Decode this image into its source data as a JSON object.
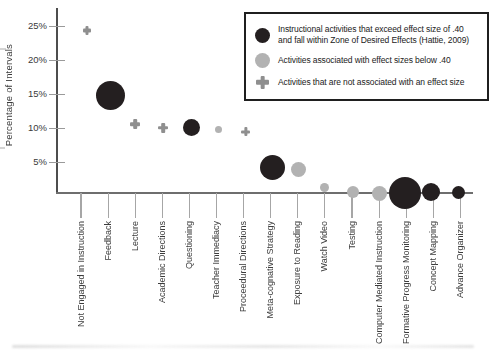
{
  "colors": {
    "black_marker": "#241f20",
    "gray_marker": "#b2b2b2",
    "plus_marker": "#8f8f8f",
    "axis": "#4d4d4d",
    "text": "#3c3c3c"
  },
  "chart_data": {
    "type": "scatter",
    "title": "",
    "xlabel": "",
    "ylabel": "Percentage of Intervals",
    "ylim": [
      0,
      26.5
    ],
    "grid": false,
    "legend_position": "top-right",
    "y_ticks": [
      {
        "value": 5,
        "label": "5%"
      },
      {
        "value": 10,
        "label": "10%"
      },
      {
        "value": 15,
        "label": "15%"
      },
      {
        "value": 20,
        "label": "20%"
      },
      {
        "value": 25,
        "label": "25%"
      }
    ],
    "legend_items": [
      {
        "icon": "black-circle",
        "color": "#241f20",
        "label": "Instructional activities that exceed effect size of .40\nand fall within Zone of Desired Effects (Hattie, 2009)"
      },
      {
        "icon": "gray-circle",
        "color": "#b2b2b2",
        "label": "Activities associated with effect sizes below .40"
      },
      {
        "icon": "plus",
        "color": "#8f8f8f",
        "label": "Activities that are not associated with an effect size"
      }
    ],
    "categories": [
      "Not Engaged in Instruction",
      "Feedback",
      "Lecture",
      "Academic Directions",
      "Questioning",
      "Teacher Immediacy",
      "Proceedural Directions",
      "Meta-cognative Strategy",
      "Exposure to Reading",
      "Watch Video",
      "Testing",
      "Computer Mediated Instruction",
      "Formative Progress Monitoring",
      "Concept Mapping",
      "Advance Organizer"
    ],
    "points": [
      {
        "category": "Not Engaged in Instruction",
        "value": 24.4,
        "marker": "plus",
        "size": 8.5,
        "dx": 6
      },
      {
        "category": "Feedback",
        "value": 14.8,
        "marker": "black-circle",
        "radius": 14.5,
        "dx": 2
      },
      {
        "category": "Lecture",
        "value": 10.6,
        "marker": "plus",
        "size": 10,
        "dx": 0
      },
      {
        "category": "Academic Directions",
        "value": 10.1,
        "marker": "plus",
        "size": 10,
        "dx": 1
      },
      {
        "category": "Questioning",
        "value": 10.1,
        "marker": "black-circle",
        "radius": 8.5,
        "dx": 2
      },
      {
        "category": "Teacher Immediacy",
        "value": 9.8,
        "marker": "gray-circle",
        "radius": 3.5,
        "dx": 2
      },
      {
        "category": "Proceedural Directions",
        "value": 9.5,
        "marker": "plus",
        "size": 9,
        "dx": 2
      },
      {
        "category": "Meta-cognative Strategy",
        "value": 4.2,
        "marker": "black-circle",
        "radius": 12.5,
        "dx": 2
      },
      {
        "category": "Exposure to Reading",
        "value": 4.0,
        "marker": "gray-circle",
        "radius": 7.5,
        "dx": 1
      },
      {
        "category": "Watch Video",
        "value": 1.3,
        "marker": "gray-circle",
        "radius": 4.5,
        "dx": 0
      },
      {
        "category": "Testing",
        "value": 0.7,
        "marker": "gray-circle",
        "radius": 6,
        "dx": 1
      },
      {
        "category": "Computer Mediated Instruction",
        "value": 0.4,
        "marker": "gray-circle",
        "radius": 7.5,
        "dx": 0
      },
      {
        "category": "Formative Progress Monitoring",
        "value": 0.5,
        "marker": "black-circle",
        "radius": 16,
        "dx": -1
      },
      {
        "category": "Concept Mapping",
        "value": 0.6,
        "marker": "black-circle",
        "radius": 9,
        "dx": -2
      },
      {
        "category": "Advance Organizer",
        "value": 0.6,
        "marker": "black-circle",
        "radius": 6.5,
        "dx": -2
      }
    ]
  }
}
